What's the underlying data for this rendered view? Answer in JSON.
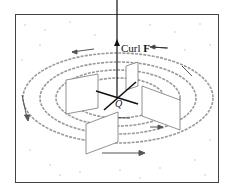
{
  "figure": {
    "type": "vector-field-curl-illustration",
    "labels": {
      "axis_label_prefix": "Curl ",
      "axis_label_vector": "F",
      "point_label": "Q"
    },
    "elements": {
      "frame": "rectangular plane region",
      "axis": "vertical arrow through Q representing curl F",
      "paddle_wheel": "two perpendicular paddle planes centered at Q",
      "flow_lines": "concentric elliptical circulation lines with arrows (counterclockwise)"
    },
    "colors": {
      "ink": "#1a1a1a",
      "flow": "#9a9a9a",
      "paper": "#ffffff"
    }
  }
}
